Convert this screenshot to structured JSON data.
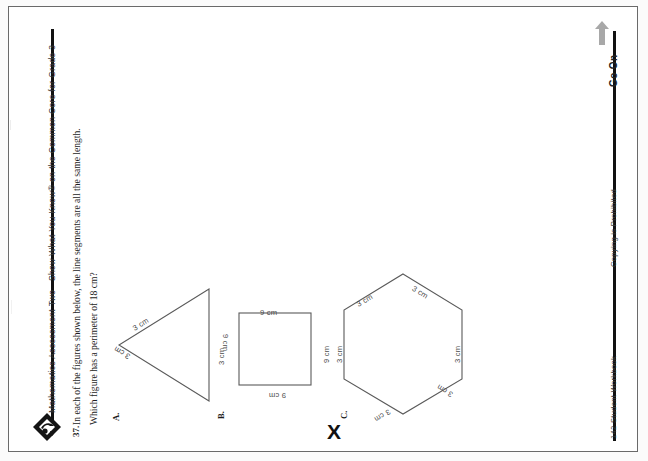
{
  "page": {
    "orientation": "rotated-90-ccw",
    "sheet_border_color": "#6a6a6a",
    "background": "#ffffff"
  },
  "header": {
    "left_title": "Mathematics Assessment Two",
    "right_title": "Show What You Know® on the Common Core for Grade 3",
    "logo_name": "show-what-you-know-logo"
  },
  "question": {
    "number": "37.",
    "prompt_line_1": "In each of the figures shown below, the line segments are all the same length.",
    "prompt_line_2": "Which figure has a perimeter of 18 cm?",
    "choices": [
      {
        "letter": "A.",
        "shape": "triangle",
        "sides": 3,
        "side_label": "3 cm",
        "labels": [
          "3 cm",
          "3 cm",
          "3 cm"
        ],
        "selected": false
      },
      {
        "letter": "B.",
        "shape": "square",
        "sides": 4,
        "side_label": "9 cm",
        "labels": [
          "9 cm",
          "9 cm",
          "9 cm",
          "9 cm"
        ],
        "selected": false
      },
      {
        "letter": "C.",
        "shape": "hexagon",
        "sides": 6,
        "side_label": "3 cm",
        "labels": [
          "3 cm",
          "3 cm",
          "3 cm",
          "3 cm",
          "3 cm",
          "3 cm"
        ],
        "selected": true
      }
    ],
    "student_mark": "X"
  },
  "footer": {
    "page_and_book": "142 Student Workbook",
    "copyright_notice": "Copying is Prohibited",
    "continue_label": "Go On",
    "continue_arrow_name": "go-on-arrow-icon",
    "arrow_color": "#a8a8a8"
  }
}
